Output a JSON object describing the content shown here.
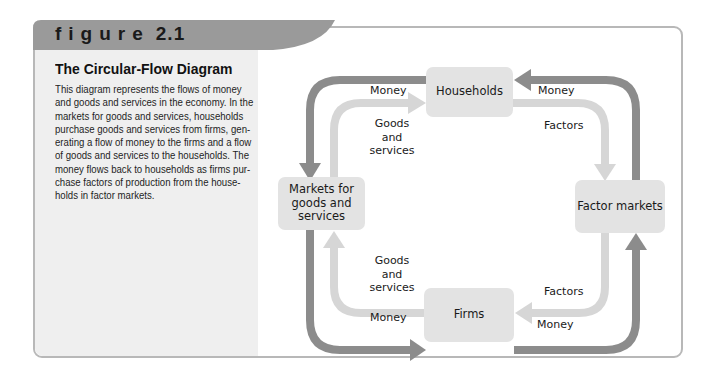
{
  "figure": {
    "label_word": "figure",
    "label_number": "2.1"
  },
  "sidebar": {
    "title": "The Circular-Flow Diagram",
    "body_lines": [
      "This diagram represents the flows of money",
      "and goods and services in the economy. In the",
      "markets for goods and services, households",
      "purchase goods and services from firms, gen-",
      "erating a flow of money to the firms and a flow",
      "of goods and services to the households. The",
      "money flows back to households as firms pur-",
      "chase factors of production from the house-",
      "holds in factor markets."
    ]
  },
  "diagram": {
    "nodes": {
      "households": "Households",
      "markets_line1": "Markets for",
      "markets_line2": "goods and",
      "markets_line3": "services",
      "factor_markets": "Factor markets",
      "firms": "Firms"
    },
    "flows": {
      "top_left_money": "Money",
      "top_right_money": "Money",
      "top_left_goods_1": "Goods",
      "top_left_goods_2": "and",
      "top_left_goods_3": "services",
      "top_right_factors": "Factors",
      "bottom_left_goods_1": "Goods",
      "bottom_left_goods_2": "and",
      "bottom_left_goods_3": "services",
      "bottom_right_factors": "Factors",
      "bottom_left_money": "Money",
      "bottom_right_money": "Money"
    },
    "colors": {
      "money_arrow": "#8c8c8c",
      "goods_factor_arrow": "#d6d6d6",
      "node_fill": "#e3e3e3",
      "header_tab": "#9a9a9a",
      "sidebar_bg": "#efefef"
    }
  }
}
